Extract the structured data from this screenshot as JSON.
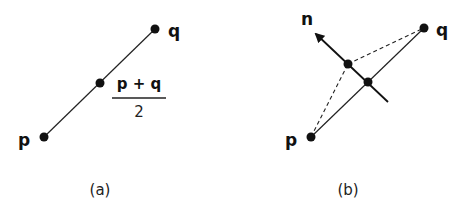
{
  "panels": [
    {
      "caption": "(a)",
      "labels": {
        "p": "p",
        "q": "q",
        "numerator": "p + q",
        "denominator": "2"
      }
    },
    {
      "caption": "(b)",
      "labels": {
        "p": "p",
        "q": "q",
        "n": "n"
      }
    }
  ],
  "colors": {
    "ink": "#111111",
    "background": "#ffffff"
  }
}
